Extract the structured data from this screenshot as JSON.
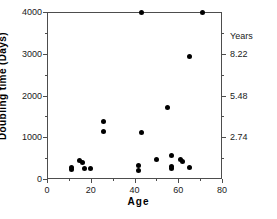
{
  "chart_data": {
    "type": "scatter",
    "title": "",
    "xlabel": "Age",
    "ylabel": "Doubling time (Days)",
    "y2label": "Years",
    "xlim": [
      0,
      80
    ],
    "ylim": [
      0,
      4000
    ],
    "y2lim": [
      0,
      10.96
    ],
    "xticks": [
      0,
      20,
      40,
      60,
      80
    ],
    "xtick_labels": [
      "0",
      "20",
      "40",
      "60",
      "80"
    ],
    "xticks_minor": [
      10,
      30,
      50,
      70
    ],
    "yticks": [
      0,
      1000,
      2000,
      3000,
      4000
    ],
    "ytick_labels": [
      "0",
      "1000",
      "2000",
      "3000",
      "4000"
    ],
    "yticks_minor": [
      500,
      1500,
      2500,
      3500
    ],
    "y2ticks": [
      1000,
      2000,
      3000
    ],
    "y2tick_labels": [
      "2.74",
      "5.48",
      "8.22"
    ],
    "y2ticks_minor": [
      500,
      1500,
      2500,
      3500
    ],
    "grid": false,
    "legend": false,
    "marker": "filled-circle",
    "marker_color": "#000000",
    "points": [
      {
        "x": 11,
        "y": 270
      },
      {
        "x": 11,
        "y": 235
      },
      {
        "x": 15,
        "y": 455
      },
      {
        "x": 16,
        "y": 400
      },
      {
        "x": 17,
        "y": 250
      },
      {
        "x": 20,
        "y": 255
      },
      {
        "x": 26,
        "y": 1375
      },
      {
        "x": 26,
        "y": 1130
      },
      {
        "x": 42,
        "y": 330
      },
      {
        "x": 42,
        "y": 210
      },
      {
        "x": 43,
        "y": 4000
      },
      {
        "x": 43,
        "y": 1110
      },
      {
        "x": 50,
        "y": 475
      },
      {
        "x": 55,
        "y": 1710
      },
      {
        "x": 57,
        "y": 555
      },
      {
        "x": 57,
        "y": 300
      },
      {
        "x": 57,
        "y": 255
      },
      {
        "x": 61,
        "y": 465
      },
      {
        "x": 62,
        "y": 430
      },
      {
        "x": 65,
        "y": 2930
      },
      {
        "x": 65,
        "y": 270
      },
      {
        "x": 71,
        "y": 4000
      }
    ]
  }
}
